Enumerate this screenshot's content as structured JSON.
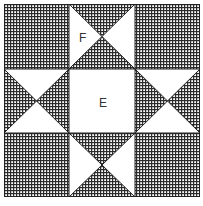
{
  "diagram": {
    "type": "quilt-block",
    "pattern_name": "Ohio Star",
    "grid": "3x3",
    "colors": {
      "fabric_dark": "#2b2b2b",
      "fabric_light": "#ffffff",
      "outline": "#222222",
      "label_text": "#333333"
    },
    "labels": {
      "center": "E",
      "star_point": "F"
    },
    "cells": [
      {
        "row": 0,
        "col": 0,
        "fill": "hatched"
      },
      {
        "row": 0,
        "col": 1,
        "fill": "hourglass",
        "hatched_sides": [
          "top",
          "bottom"
        ],
        "white_sides": [
          "left",
          "right"
        ],
        "label": "F"
      },
      {
        "row": 0,
        "col": 2,
        "fill": "hatched"
      },
      {
        "row": 1,
        "col": 0,
        "fill": "hourglass",
        "hatched_sides": [
          "left",
          "right"
        ],
        "white_sides": [
          "top",
          "bottom"
        ]
      },
      {
        "row": 1,
        "col": 1,
        "fill": "white",
        "label": "E"
      },
      {
        "row": 1,
        "col": 2,
        "fill": "hourglass",
        "hatched_sides": [
          "left",
          "right"
        ],
        "white_sides": [
          "top",
          "bottom"
        ]
      },
      {
        "row": 2,
        "col": 0,
        "fill": "hatched"
      },
      {
        "row": 2,
        "col": 1,
        "fill": "hourglass",
        "hatched_sides": [
          "top",
          "bottom"
        ],
        "white_sides": [
          "left",
          "right"
        ]
      },
      {
        "row": 2,
        "col": 2,
        "fill": "hatched"
      }
    ]
  }
}
